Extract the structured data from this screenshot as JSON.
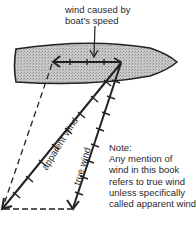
{
  "diagram": {
    "top_label": {
      "line1": "wind caused by",
      "line2": "boat's speed"
    },
    "vectors": {
      "apparent_wind_label": "apparent wind",
      "true_wind_label": "true wind"
    },
    "note": {
      "line1": "Note:",
      "line2": "Any mention of",
      "line3": "wind in this book",
      "line4": "refers to true wind",
      "line5": "unless specifically",
      "line6": "called apparent wind"
    },
    "colors": {
      "hull_fill": "#bdbdbd",
      "line": "#222222"
    }
  }
}
